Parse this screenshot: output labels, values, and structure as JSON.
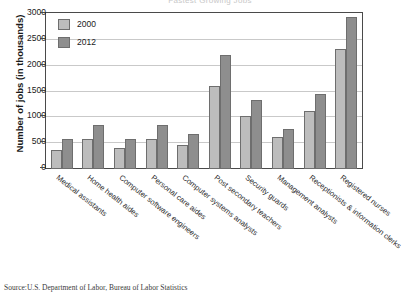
{
  "chart_data": {
    "type": "bar",
    "title": "Fastest Growing Jobs",
    "xlabel": "",
    "ylabel": "Number of jobs (in thousands)",
    "ylim": [
      0,
      3000
    ],
    "yticks": [
      0,
      500,
      1000,
      1500,
      2000,
      2500,
      3000
    ],
    "ytick_labels": [
      "0",
      "500",
      "1000",
      "1500",
      "2000",
      "2500",
      "3000"
    ],
    "grid": true,
    "legend_position": "top-left",
    "categories": [
      "Medical assistants",
      "Home health aides",
      "Computer software engineers",
      "Personal care aides",
      "Computer systems analysts",
      "Post secondary teachers",
      "Security guards",
      "Management analysts",
      "Receptionists & information clerks",
      "Registered nurses"
    ],
    "series": [
      {
        "name": "2000",
        "color": "#bdbdbd",
        "values": [
          370,
          580,
          400,
          580,
          460,
          1600,
          1020,
          610,
          1130,
          2320
        ]
      },
      {
        "name": "2012",
        "color": "#8e8e8e",
        "values": [
          590,
          860,
          580,
          860,
          670,
          2210,
          1340,
          780,
          1460,
          2940
        ]
      }
    ]
  },
  "source_note": "Source:U.S. Department of Labor, Bureau of Labor Statistics"
}
